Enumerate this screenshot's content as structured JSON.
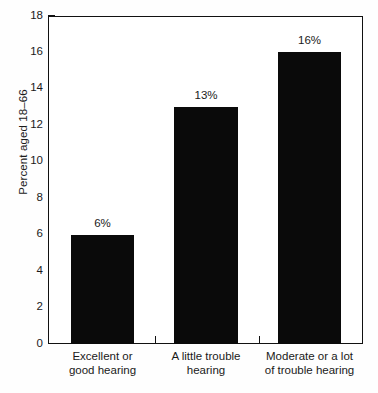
{
  "chart_data": {
    "type": "bar",
    "title": "",
    "xlabel": "",
    "ylabel": "Percent aged 18–66",
    "ylim": [
      0,
      18
    ],
    "grid": false,
    "legend": null,
    "categories": [
      "Excellent or good hearing",
      "A little trouble hearing",
      "Moderate or a lot of trouble hearing"
    ],
    "category_lines": [
      [
        "Excellent or",
        "good hearing"
      ],
      [
        "A little trouble",
        "hearing"
      ],
      [
        "Moderate or a lot",
        "of trouble hearing"
      ]
    ],
    "values": [
      6,
      13,
      16
    ],
    "data_labels": [
      "6%",
      "13%",
      "16%"
    ],
    "ytick_labels": [
      "0",
      "2",
      "4",
      "6",
      "8",
      "10",
      "12",
      "14",
      "16",
      "18"
    ],
    "ytick_values": [
      0,
      2,
      4,
      6,
      8,
      10,
      12,
      14,
      16,
      18
    ],
    "colors": {
      "bar_fill": "#0a0a0a",
      "axis": "#111111",
      "text": "#1a1a1a",
      "background": "#ffffff"
    }
  }
}
